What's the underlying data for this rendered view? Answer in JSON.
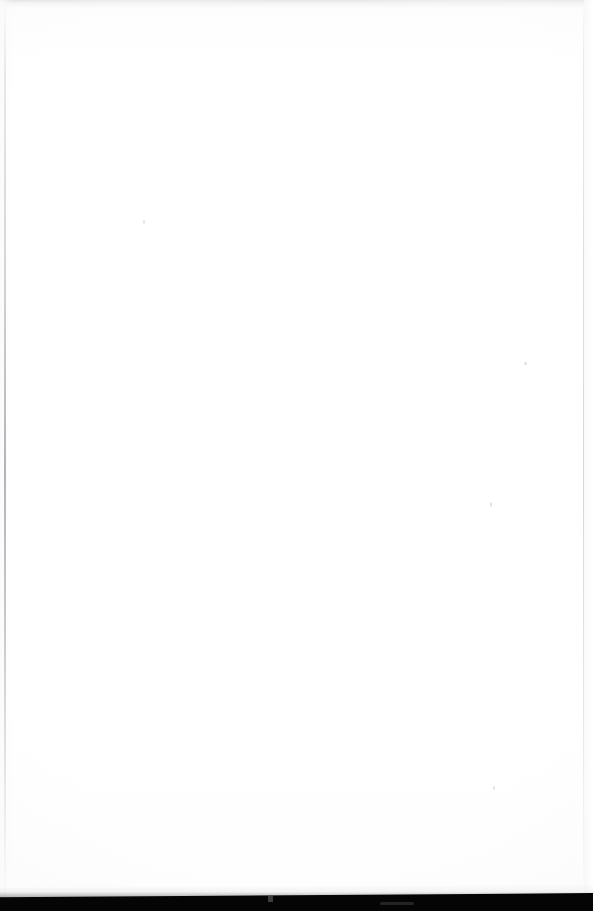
{
  "page": {
    "kind": "scanned-blank-page",
    "width": 593,
    "height": 911,
    "visible_text": "",
    "body_text": "",
    "description": "Blank scanned page",
    "colors": {
      "paper": "#fdfdfd",
      "paper_white": "#ffffff",
      "top_edge_band": "#f2f2f4",
      "gutter_shadow": "#96969f",
      "right_trim_edge": "#c4c4cc",
      "bottom_band": "#050505"
    }
  },
  "regions": {
    "top_edge": {
      "name": "top-edge-band",
      "label": "",
      "y": 0,
      "height": 9
    },
    "left_gutter": {
      "name": "gutter-shadow-left",
      "label": "",
      "x": 4,
      "width": 2
    },
    "right_edge": {
      "name": "page-trim-edge-right",
      "label": "",
      "x": 583,
      "width": 1
    },
    "bottom_band": {
      "name": "bottom-dark-band",
      "label": "",
      "y": 894,
      "height": 17
    },
    "content_area": {
      "name": "page-content-area",
      "label": "",
      "text": ""
    }
  },
  "specks": [
    {
      "label": "",
      "x": 143,
      "y": 220
    },
    {
      "label": "",
      "x": 524,
      "y": 362
    },
    {
      "label": "",
      "x": 490,
      "y": 502
    },
    {
      "label": "",
      "x": 493,
      "y": 786
    }
  ]
}
